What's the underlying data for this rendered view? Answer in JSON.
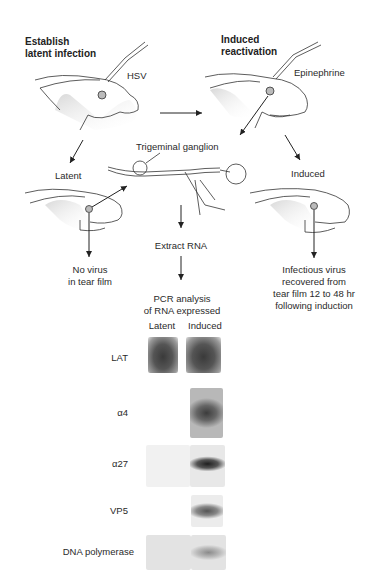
{
  "headings": {
    "left": [
      "Establish",
      "latent infection"
    ],
    "right": [
      "Induced",
      "reactivation"
    ]
  },
  "labels": {
    "hsv": "HSV",
    "epinephrine": "Epinephrine",
    "trigeminal_ganglion": "Trigeminal ganglion",
    "latent": "Latent",
    "induced": "Induced",
    "no_virus": [
      "No virus",
      "in tear film"
    ],
    "infectious_virus": [
      "Infectious virus",
      "recovered from",
      "tear film 12 to 48 hr",
      "following induction"
    ],
    "extract_rna": "Extract RNA",
    "pcr": [
      "PCR analysis",
      "of RNA expressed"
    ]
  },
  "blot": {
    "columns": [
      "Latent",
      "Induced"
    ],
    "rows": [
      {
        "label": "LAT",
        "latent": "strong",
        "induced": "strong"
      },
      {
        "label": "α4",
        "latent": "none",
        "induced": "strong"
      },
      {
        "label": "α27",
        "latent": "none",
        "induced": "strong"
      },
      {
        "label": "VP5",
        "latent": "none",
        "induced": "moderate"
      },
      {
        "label": "DNA polymerase",
        "latent": "none",
        "induced": "weak"
      }
    ]
  }
}
